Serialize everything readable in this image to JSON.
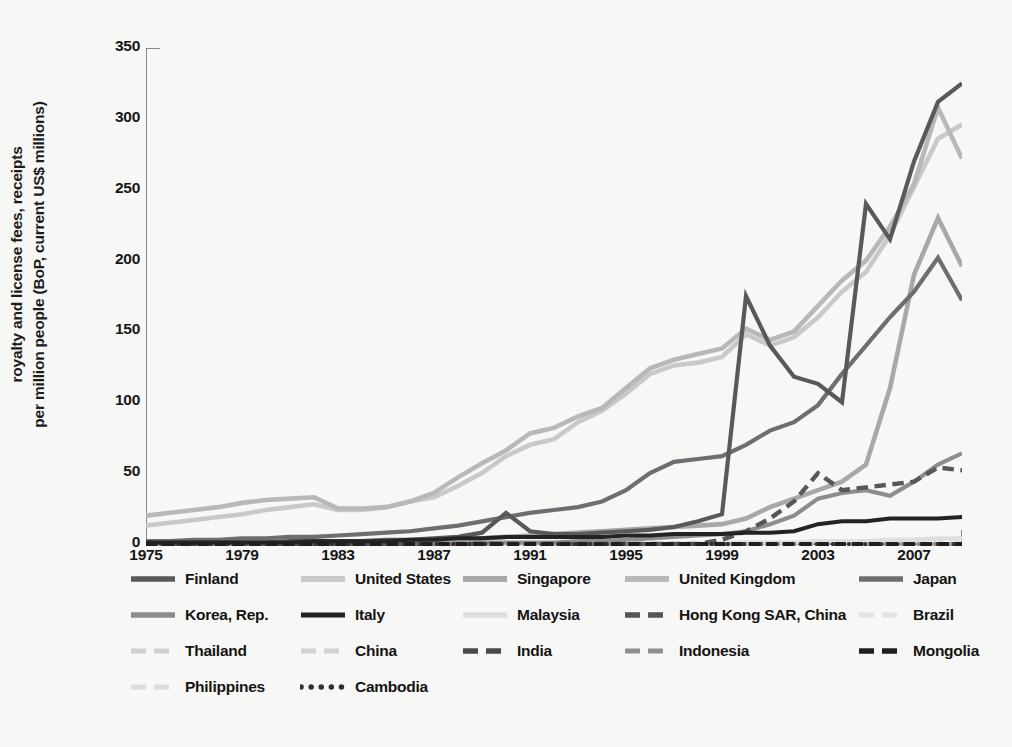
{
  "chart_data": {
    "type": "line",
    "title": "",
    "xlabel": "",
    "ylabel_line1": "royalty and license fees, receipts",
    "ylabel_line2": "per million people (BoP, current US$ millions)",
    "xlim": [
      1975,
      2009
    ],
    "ylim": [
      0,
      350
    ],
    "ytick_values": [
      0,
      50,
      100,
      150,
      200,
      250,
      300,
      350
    ],
    "xtick_values": [
      1975,
      1979,
      1983,
      1987,
      1991,
      1995,
      1999,
      2003,
      2007
    ],
    "xtick_labels": [
      "1975",
      "1979",
      "1983",
      "1987",
      "1991",
      "1995",
      "1999",
      "2003",
      "2007"
    ],
    "ytick_labels": [
      "0",
      "50",
      "100",
      "150",
      "200",
      "250",
      "300",
      "350"
    ],
    "grid": false,
    "legend_position": "below",
    "x": [
      1975,
      1976,
      1977,
      1978,
      1979,
      1980,
      1981,
      1982,
      1983,
      1984,
      1985,
      1986,
      1987,
      1988,
      1989,
      1990,
      1991,
      1992,
      1993,
      1994,
      1995,
      1996,
      1997,
      1998,
      1999,
      2000,
      2001,
      2002,
      2003,
      2004,
      2005,
      2006,
      2007,
      2008,
      2009
    ],
    "series": [
      {
        "name": "Finland",
        "color": "#59595b",
        "style": "solid",
        "width": 4.2,
        "values": [
          1,
          1,
          1,
          1,
          1,
          1,
          2,
          2,
          2,
          2,
          3,
          3,
          4,
          5,
          8,
          22,
          9,
          7,
          7,
          8,
          9,
          10,
          12,
          16,
          21,
          175,
          140,
          118,
          113,
          100,
          240,
          215,
          270,
          312,
          325
        ]
      },
      {
        "name": "United States",
        "color": "#c9c9c7",
        "style": "solid",
        "width": 4.6,
        "values": [
          13,
          15,
          17,
          19,
          21,
          24,
          26,
          28,
          24,
          24,
          26,
          30,
          33,
          41,
          50,
          62,
          70,
          74,
          86,
          94,
          106,
          120,
          126,
          128,
          132,
          148,
          140,
          146,
          160,
          178,
          192,
          218,
          252,
          286,
          296
        ]
      },
      {
        "name": "Singapore",
        "color": "#a8a8a6",
        "style": "solid",
        "width": 4.6,
        "values": [
          1,
          1,
          1,
          1,
          1,
          1,
          1,
          1,
          1,
          1,
          1,
          2,
          2,
          3,
          4,
          5,
          6,
          7,
          8,
          9,
          10,
          11,
          12,
          13,
          14,
          18,
          26,
          32,
          38,
          44,
          56,
          110,
          190,
          230,
          196
        ]
      },
      {
        "name": "United Kingdom",
        "color": "#b8b8b6",
        "style": "solid",
        "width": 4.6,
        "values": [
          20,
          22,
          24,
          26,
          29,
          31,
          32,
          33,
          25,
          25,
          26,
          30,
          36,
          47,
          57,
          66,
          78,
          82,
          90,
          96,
          110,
          124,
          130,
          134,
          138,
          152,
          144,
          150,
          168,
          186,
          200,
          224,
          254,
          308,
          272
        ]
      },
      {
        "name": "Japan",
        "color": "#6e6e70",
        "style": "solid",
        "width": 4.2,
        "values": [
          2,
          2,
          3,
          3,
          4,
          4,
          5,
          5,
          6,
          7,
          8,
          9,
          11,
          13,
          16,
          19,
          22,
          24,
          26,
          30,
          38,
          50,
          58,
          60,
          62,
          70,
          80,
          86,
          98,
          120,
          140,
          160,
          178,
          202,
          172
        ]
      },
      {
        "name": "Korea, Rep.",
        "color": "#8d8d8b",
        "style": "solid",
        "width": 4.2,
        "values": [
          0,
          0,
          0,
          0,
          0,
          0,
          0,
          0,
          0,
          0,
          0,
          0,
          0,
          0,
          1,
          1,
          1,
          1,
          2,
          2,
          3,
          4,
          5,
          6,
          7,
          9,
          14,
          20,
          32,
          36,
          38,
          34,
          44,
          56,
          64
        ]
      },
      {
        "name": "Italy",
        "color": "#232323",
        "style": "solid",
        "width": 4.0,
        "values": [
          1,
          1,
          1,
          1,
          1,
          1,
          1,
          2,
          2,
          2,
          2,
          3,
          3,
          4,
          4,
          5,
          5,
          5,
          5,
          5,
          6,
          6,
          7,
          7,
          7,
          8,
          8,
          9,
          14,
          16,
          16,
          18,
          18,
          18,
          19
        ]
      },
      {
        "name": "Malaysia",
        "color": "#dedede",
        "style": "solid",
        "width": 4.4,
        "values": [
          0,
          0,
          0,
          0,
          0,
          0,
          0,
          0,
          0,
          0,
          0,
          0,
          0,
          0,
          0,
          0,
          0,
          0,
          0,
          0,
          0,
          0,
          0,
          0,
          1,
          1,
          1,
          1,
          2,
          2,
          2,
          3,
          3,
          4,
          4
        ]
      },
      {
        "name": "Hong Kong SAR, China",
        "color": "#575757",
        "style": "dashed",
        "width": 4.4,
        "values": [
          0,
          0,
          0,
          0,
          0,
          0,
          0,
          0,
          0,
          0,
          0,
          0,
          0,
          0,
          0,
          0,
          0,
          0,
          0,
          0,
          0,
          0,
          0,
          0,
          3,
          9,
          18,
          30,
          50,
          38,
          40,
          42,
          44,
          54,
          52
        ]
      },
      {
        "name": "Brazil",
        "color": "#e2e2e2",
        "style": "dashed",
        "width": 4.0,
        "values": [
          0,
          0,
          0,
          0,
          0,
          0,
          0,
          0,
          0,
          0,
          0,
          0,
          0,
          0,
          0,
          0,
          0,
          0,
          0,
          0,
          0,
          0,
          0,
          0,
          0,
          1,
          1,
          1,
          1,
          1,
          1,
          1,
          2,
          2,
          2
        ]
      },
      {
        "name": "Thailand",
        "color": "#cfcfcd",
        "style": "dashed",
        "width": 4.0,
        "values": [
          0,
          0,
          0,
          0,
          0,
          0,
          0,
          0,
          0,
          0,
          0,
          0,
          0,
          0,
          0,
          0,
          0,
          0,
          0,
          0,
          0,
          0,
          0,
          0,
          0,
          0,
          0,
          0,
          0,
          0,
          0,
          0,
          0,
          0,
          0
        ]
      },
      {
        "name": "China",
        "color": "#d2d2d0",
        "style": "dashed",
        "width": 4.0,
        "values": [
          0,
          0,
          0,
          0,
          0,
          0,
          0,
          0,
          0,
          0,
          0,
          0,
          0,
          0,
          0,
          0,
          0,
          0,
          0,
          0,
          0,
          0,
          0,
          0,
          0,
          0,
          0,
          0,
          0,
          0,
          0,
          0,
          0,
          0,
          0
        ]
      },
      {
        "name": "India",
        "color": "#4a4a4a",
        "style": "dashed",
        "width": 4.2,
        "values": [
          0,
          0,
          0,
          0,
          0,
          0,
          0,
          0,
          0,
          0,
          0,
          0,
          0,
          0,
          0,
          0,
          0,
          0,
          0,
          0,
          0,
          0,
          0,
          0,
          0,
          0,
          0,
          0,
          0,
          0,
          0,
          0,
          0,
          0,
          0
        ]
      },
      {
        "name": "Indonesia",
        "color": "#8f8f8d",
        "style": "dashed",
        "width": 4.0,
        "values": [
          0,
          0,
          0,
          0,
          0,
          0,
          0,
          0,
          0,
          0,
          0,
          0,
          0,
          0,
          0,
          0,
          0,
          0,
          0,
          0,
          0,
          0,
          0,
          0,
          0,
          0,
          0,
          0,
          0,
          0,
          0,
          0,
          0,
          0,
          0
        ]
      },
      {
        "name": "Mongolia",
        "color": "#1f1f1f",
        "style": "dashed",
        "width": 4.2,
        "values": [
          0,
          0,
          0,
          0,
          0,
          0,
          0,
          0,
          0,
          0,
          0,
          0,
          0,
          0,
          0,
          0,
          0,
          0,
          0,
          0,
          0,
          0,
          0,
          0,
          0,
          0,
          0,
          0,
          0,
          0,
          0,
          0,
          0,
          0,
          0
        ]
      },
      {
        "name": "Philippines",
        "color": "#dcdcdc",
        "style": "dashed",
        "width": 4.0,
        "values": [
          0,
          0,
          0,
          0,
          0,
          0,
          0,
          0,
          0,
          0,
          0,
          0,
          0,
          0,
          0,
          0,
          0,
          0,
          0,
          0,
          0,
          0,
          0,
          0,
          0,
          0,
          0,
          0,
          0,
          0,
          0,
          0,
          0,
          0,
          0
        ]
      },
      {
        "name": "Cambodia",
        "color": "#303030",
        "style": "dotted",
        "width": 4.2,
        "values": [
          0,
          0,
          0,
          0,
          0,
          0,
          0,
          0,
          0,
          0,
          0,
          0,
          0,
          0,
          0,
          0,
          0,
          0,
          0,
          0,
          0,
          0,
          0,
          0,
          0,
          0,
          0,
          0,
          0,
          0,
          0,
          0,
          0,
          0,
          0
        ]
      }
    ]
  },
  "legend": {
    "rows": [
      [
        {
          "label": "Finland",
          "series": 0
        },
        {
          "label": "United States",
          "series": 1
        },
        {
          "label": "Singapore",
          "series": 2
        },
        {
          "label": "United Kingdom",
          "series": 3
        },
        {
          "label": "Japan",
          "series": 4
        }
      ],
      [
        {
          "label": "Korea, Rep.",
          "series": 5
        },
        {
          "label": "Italy",
          "series": 6
        },
        {
          "label": "Malaysia",
          "series": 7
        },
        {
          "label": "Hong Kong SAR, China",
          "series": 8
        },
        {
          "label": "Brazil",
          "series": 9
        }
      ],
      [
        {
          "label": "Thailand",
          "series": 10
        },
        {
          "label": "China",
          "series": 11
        },
        {
          "label": "India",
          "series": 12
        },
        {
          "label": "Indonesia",
          "series": 13
        },
        {
          "label": "Mongolia",
          "series": 14
        }
      ],
      [
        {
          "label": "Philippines",
          "series": 15
        },
        {
          "label": "Cambodia",
          "series": 16
        }
      ]
    ],
    "column_offsets": [
      0,
      170,
      332,
      494,
      728
    ]
  },
  "colors": {
    "background": "#f7f7f5",
    "axis": "#6a6a6a",
    "text": "#161616"
  }
}
